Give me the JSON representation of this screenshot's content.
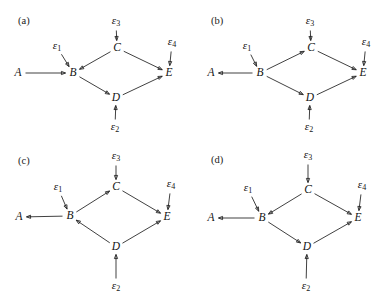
{
  "figure": {
    "type": "diagram",
    "stroke_color": "#1f1f1f",
    "text_color": "#141414",
    "background": "#ffffff"
  },
  "glyphs": {
    "epsilon": "ε",
    "sub1": "1",
    "sub2": "2",
    "sub3": "3",
    "sub4": "4"
  },
  "panels": [
    {
      "id": "a",
      "label": "(a)",
      "nodes": [
        {
          "name": "A",
          "label": "A",
          "x": 18,
          "y": 73
        },
        {
          "name": "B",
          "label": "B",
          "x": 73,
          "y": 73
        },
        {
          "name": "C",
          "label": "C",
          "x": 117,
          "y": 48
        },
        {
          "name": "D",
          "label": "D",
          "x": 116,
          "y": 98
        },
        {
          "name": "E",
          "label": "E",
          "x": 169,
          "y": 73
        }
      ],
      "noises": [
        {
          "name": "e1",
          "label": "ε",
          "sub": "1",
          "x": 57,
          "y": 47
        },
        {
          "name": "e2",
          "label": "ε",
          "sub": "2",
          "x": 115,
          "y": 128
        },
        {
          "name": "e3",
          "label": "ε",
          "sub": "3",
          "x": 116,
          "y": 22
        },
        {
          "name": "e4",
          "label": "ε",
          "sub": "4",
          "x": 172,
          "y": 43
        }
      ],
      "edges": [
        {
          "from": "A",
          "to": "B",
          "desc": "A to B"
        },
        {
          "from": "C",
          "to": "B",
          "desc": "C to B"
        },
        {
          "from": "B",
          "to": "D",
          "desc": "B to D"
        },
        {
          "from": "C",
          "to": "E",
          "desc": "C to E"
        },
        {
          "from": "D",
          "to": "E",
          "desc": "D to E"
        },
        {
          "from": "e1",
          "to": "B",
          "desc": "epsilon1 to B"
        },
        {
          "from": "e2",
          "to": "D",
          "desc": "epsilon2 to D"
        },
        {
          "from": "e3",
          "to": "C",
          "desc": "epsilon3 to C"
        },
        {
          "from": "e4",
          "to": "E",
          "desc": "epsilon4 to E"
        }
      ]
    },
    {
      "id": "b",
      "label": "(b)",
      "nodes": [
        {
          "name": "A",
          "label": "A",
          "x": 17,
          "y": 73
        },
        {
          "name": "B",
          "label": "B",
          "x": 66,
          "y": 73
        },
        {
          "name": "C",
          "label": "C",
          "x": 117,
          "y": 48
        },
        {
          "name": "D",
          "label": "D",
          "x": 116,
          "y": 98
        },
        {
          "name": "E",
          "label": "E",
          "x": 169,
          "y": 73
        }
      ],
      "noises": [
        {
          "name": "e1",
          "label": "ε",
          "sub": "1",
          "x": 53,
          "y": 47
        },
        {
          "name": "e2",
          "label": "ε",
          "sub": "2",
          "x": 115,
          "y": 128
        },
        {
          "name": "e3",
          "label": "ε",
          "sub": "3",
          "x": 116,
          "y": 22
        },
        {
          "name": "e4",
          "label": "ε",
          "sub": "4",
          "x": 172,
          "y": 43
        }
      ],
      "edges": [
        {
          "from": "B",
          "to": "A",
          "desc": "B to A"
        },
        {
          "from": "B",
          "to": "C",
          "desc": "B to C"
        },
        {
          "from": "B",
          "to": "D",
          "desc": "B to D"
        },
        {
          "from": "C",
          "to": "E",
          "desc": "C to E"
        },
        {
          "from": "D",
          "to": "E",
          "desc": "D to E"
        },
        {
          "from": "e1",
          "to": "B",
          "desc": "epsilon1 to B"
        },
        {
          "from": "e2",
          "to": "D",
          "desc": "epsilon2 to D"
        },
        {
          "from": "e3",
          "to": "C",
          "desc": "epsilon3 to C"
        },
        {
          "from": "e4",
          "to": "E",
          "desc": "epsilon4 to E"
        }
      ]
    },
    {
      "id": "c",
      "label": "(c)",
      "nodes": [
        {
          "name": "A",
          "label": "A",
          "x": 19,
          "y": 68
        },
        {
          "name": "B",
          "label": "B",
          "x": 70,
          "y": 67
        },
        {
          "name": "C",
          "label": "C",
          "x": 116,
          "y": 38
        },
        {
          "name": "D",
          "label": "D",
          "x": 116,
          "y": 98
        },
        {
          "name": "E",
          "label": "E",
          "x": 167,
          "y": 68
        }
      ],
      "noises": [
        {
          "name": "e1",
          "label": "ε",
          "sub": "1",
          "x": 58,
          "y": 39
        },
        {
          "name": "e2",
          "label": "ε",
          "sub": "2",
          "x": 116,
          "y": 138
        },
        {
          "name": "e3",
          "label": "ε",
          "sub": "3",
          "x": 116,
          "y": 8
        },
        {
          "name": "e4",
          "label": "ε",
          "sub": "4",
          "x": 171,
          "y": 36
        }
      ],
      "edges": [
        {
          "from": "B",
          "to": "A",
          "desc": "B to A"
        },
        {
          "from": "B",
          "to": "C",
          "desc": "B to C"
        },
        {
          "from": "D",
          "to": "B",
          "desc": "D to B"
        },
        {
          "from": "C",
          "to": "E",
          "desc": "C to E"
        },
        {
          "from": "D",
          "to": "E",
          "desc": "D to E"
        },
        {
          "from": "e1",
          "to": "B",
          "desc": "epsilon1 to B"
        },
        {
          "from": "e2",
          "to": "D",
          "desc": "epsilon2 to D"
        },
        {
          "from": "e3",
          "to": "C",
          "desc": "epsilon3 to C"
        },
        {
          "from": "e4",
          "to": "E",
          "desc": "epsilon4 to E"
        }
      ]
    },
    {
      "id": "d",
      "label": "(d)",
      "nodes": [
        {
          "name": "A",
          "label": "A",
          "x": 17,
          "y": 69
        },
        {
          "name": "B",
          "label": "B",
          "x": 68,
          "y": 69
        },
        {
          "name": "C",
          "label": "C",
          "x": 114,
          "y": 41
        },
        {
          "name": "D",
          "label": "D",
          "x": 113,
          "y": 98
        },
        {
          "name": "E",
          "label": "E",
          "x": 164,
          "y": 69
        }
      ],
      "noises": [
        {
          "name": "e1",
          "label": "ε",
          "sub": "1",
          "x": 54,
          "y": 40
        },
        {
          "name": "e2",
          "label": "ε",
          "sub": "2",
          "x": 112,
          "y": 138
        },
        {
          "name": "e3",
          "label": "ε",
          "sub": "3",
          "x": 114,
          "y": 7
        },
        {
          "name": "e4",
          "label": "ε",
          "sub": "4",
          "x": 168,
          "y": 37
        }
      ],
      "edges": [
        {
          "from": "B",
          "to": "A",
          "desc": "B to A"
        },
        {
          "from": "C",
          "to": "B",
          "desc": "C to B"
        },
        {
          "from": "B",
          "to": "D",
          "desc": "B to D"
        },
        {
          "from": "C",
          "to": "E",
          "desc": "C to E"
        },
        {
          "from": "D",
          "to": "E",
          "desc": "D to E"
        },
        {
          "from": "e1",
          "to": "B",
          "desc": "epsilon1 to B"
        },
        {
          "from": "e2",
          "to": "D",
          "desc": "epsilon2 to D"
        },
        {
          "from": "e3",
          "to": "C",
          "desc": "epsilon3 to C"
        },
        {
          "from": "e4",
          "to": "E",
          "desc": "epsilon4 to E"
        }
      ]
    }
  ],
  "panel_positions": [
    {
      "id": "a",
      "left": 0,
      "top": 0,
      "label_x": 18,
      "label_y": 15
    },
    {
      "id": "b",
      "left": 194,
      "top": 0,
      "label_x": 17,
      "label_y": 15
    },
    {
      "id": "c",
      "left": 0,
      "top": 149,
      "label_x": 18,
      "label_y": 6
    },
    {
      "id": "d",
      "left": 194,
      "top": 149,
      "label_x": 17,
      "label_y": 5
    }
  ]
}
